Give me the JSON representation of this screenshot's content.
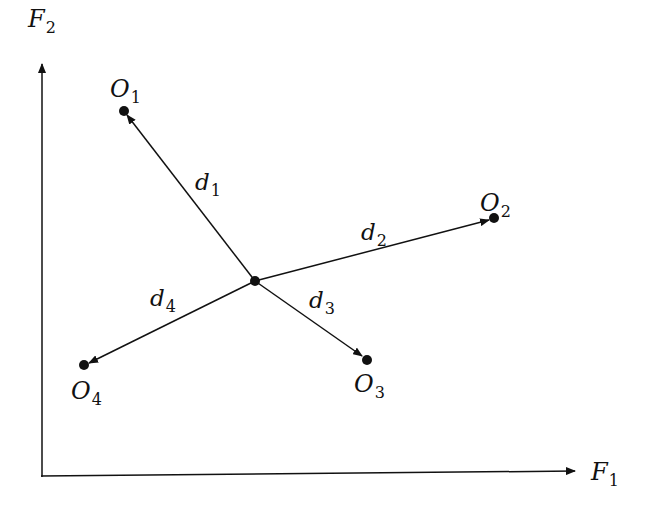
{
  "diagram": {
    "axes": {
      "x_label": "F",
      "x_sub": "1",
      "y_label": "F",
      "y_sub": "2",
      "origin": [
        42,
        476
      ],
      "x_end": [
        577,
        476
      ],
      "y_end": [
        42,
        62
      ]
    },
    "center": [
      255,
      281
    ],
    "points": [
      {
        "id": "O1",
        "label": "O",
        "sub": "1",
        "pos": [
          124,
          111
        ],
        "label_pos": [
          110,
          96
        ]
      },
      {
        "id": "O2",
        "label": "O",
        "sub": "2",
        "pos": [
          494,
          218
        ],
        "label_pos": [
          478,
          210
        ]
      },
      {
        "id": "O3",
        "label": "O",
        "sub": "3",
        "pos": [
          367,
          360
        ],
        "label_pos": [
          352,
          392
        ]
      },
      {
        "id": "O4",
        "label": "O",
        "sub": "4",
        "pos": [
          84,
          365
        ],
        "label_pos": [
          70,
          398
        ]
      }
    ],
    "distances": [
      {
        "label": "d",
        "sub": "1",
        "to": "O1",
        "label_pos": [
          195,
          191
        ]
      },
      {
        "label": "d",
        "sub": "2",
        "to": "O2",
        "label_pos": [
          360,
          241
        ]
      },
      {
        "label": "d",
        "sub": "3",
        "to": "O3",
        "label_pos": [
          308,
          310
        ]
      },
      {
        "label": "d",
        "sub": "4",
        "to": "O4",
        "label_pos": [
          150,
          307
        ]
      }
    ],
    "colors": {
      "ink": "#111111",
      "background": "#ffffff"
    }
  }
}
